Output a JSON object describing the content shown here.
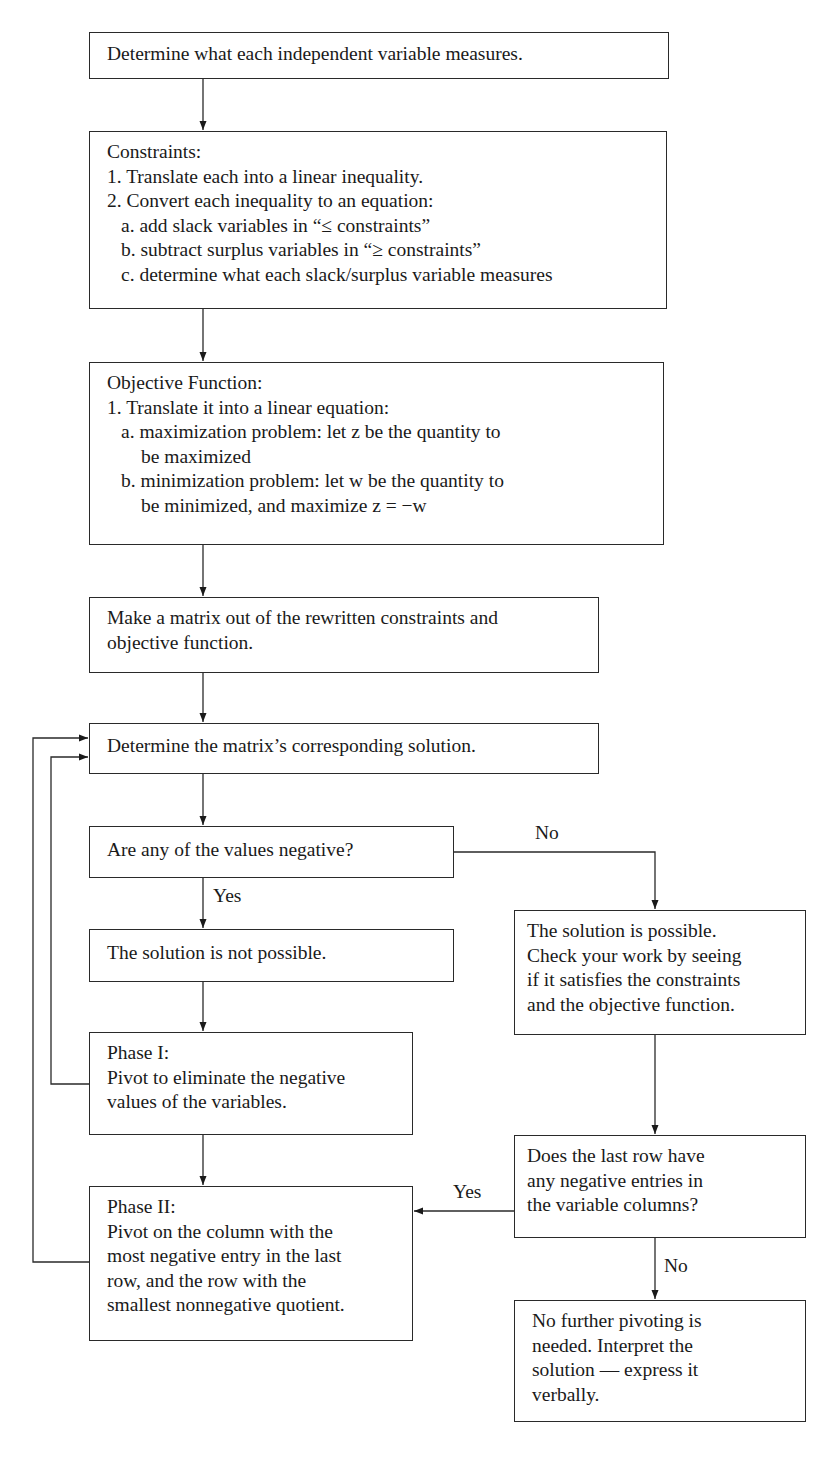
{
  "diagram": {
    "type": "flowchart",
    "nodes": {
      "n1": {
        "lines": [
          "Determine what each independent variable measures."
        ]
      },
      "n2": {
        "heading": "Constraints:",
        "lines": [
          "1. Translate each into a linear inequality.",
          "2. Convert each inequality to an equation:",
          "a.  add slack variables in “≤ constraints”",
          "b.  subtract surplus variables in “≥ constraints”",
          "c.  determine what each slack/surplus variable measures"
        ]
      },
      "n3": {
        "heading": "Objective Function:",
        "lines": [
          "1. Translate it into a linear equation:",
          "a.  maximization problem: let z be the quantity to",
          "be maximized",
          "b.  minimization problem: let w be the quantity to",
          "be minimized, and maximize z = −w"
        ]
      },
      "n4": {
        "lines": [
          "Make a matrix out of the rewritten constraints and",
          "objective function."
        ]
      },
      "n5": {
        "lines": [
          "Determine the matrix’s corresponding solution."
        ]
      },
      "n6": {
        "lines": [
          "Are any of the values negative?"
        ]
      },
      "n7": {
        "lines": [
          "The solution is not possible."
        ]
      },
      "n8": {
        "heading": "Phase I:",
        "lines": [
          "Pivot to eliminate the negative",
          "values of the variables."
        ]
      },
      "n9": {
        "heading": "Phase II:",
        "lines": [
          "Pivot on the column with the",
          "most negative entry in the last",
          "row, and the row with the",
          "smallest nonnegative quotient."
        ]
      },
      "n10": {
        "lines": [
          "The solution is possible.",
          "Check your work by seeing",
          "if it satisfies the constraints",
          "and the objective function."
        ]
      },
      "n11": {
        "lines": [
          "Does the last row have",
          "any negative entries in",
          "the variable columns?"
        ]
      },
      "n12": {
        "lines": [
          "No further pivoting is",
          "needed. Interpret the",
          "solution — express it",
          "verbally."
        ]
      }
    },
    "edge_labels": {
      "n6_no": "No",
      "n6_yes": "Yes",
      "n11_yes": "Yes",
      "n11_no": "No"
    },
    "edges": [
      {
        "from": "n1",
        "to": "n2"
      },
      {
        "from": "n2",
        "to": "n3"
      },
      {
        "from": "n3",
        "to": "n4"
      },
      {
        "from": "n4",
        "to": "n5"
      },
      {
        "from": "n5",
        "to": "n6"
      },
      {
        "from": "n6",
        "to": "n7",
        "label": "Yes"
      },
      {
        "from": "n6",
        "to": "n10",
        "label": "No"
      },
      {
        "from": "n7",
        "to": "n8"
      },
      {
        "from": "n8",
        "to": "n9"
      },
      {
        "from": "n8",
        "to": "n5"
      },
      {
        "from": "n9",
        "to": "n5"
      },
      {
        "from": "n10",
        "to": "n11"
      },
      {
        "from": "n11",
        "to": "n9",
        "label": "Yes"
      },
      {
        "from": "n11",
        "to": "n12",
        "label": "No"
      }
    ]
  }
}
